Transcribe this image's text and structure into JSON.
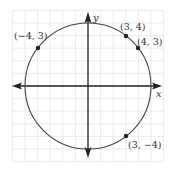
{
  "diagram": {
    "type": "coordinate-plane-circle",
    "origin_px": [
      88,
      86
    ],
    "unit_px": 12.6,
    "radius_units": 5,
    "grid": {
      "min": -6,
      "max": 6,
      "color": "#e6e6e6"
    },
    "axes": {
      "x_label": "x",
      "y_label": "y",
      "color": "#222222"
    },
    "circle_color": "#444444",
    "points": [
      {
        "x": -4,
        "y": 3,
        "label": "(−4, 3)"
      },
      {
        "x": 3,
        "y": 4,
        "label": "(3, 4)"
      },
      {
        "x": 4,
        "y": 3,
        "label": "(4, 3)"
      },
      {
        "x": 3,
        "y": -4,
        "label": "(3, −4)"
      }
    ]
  }
}
